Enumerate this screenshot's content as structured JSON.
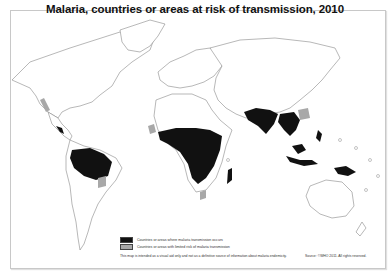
{
  "title": "Malaria, countries or areas at risk of transmission, 2010",
  "legend": {
    "items": [
      {
        "label": "Countries or areas where malaria transmission occurs",
        "color": "#111111"
      },
      {
        "label": "Countries or areas with limited risk of malaria transmission",
        "color": "#a8a8a8"
      }
    ]
  },
  "note": "This map is intended as a visual aid only and not as a definitive source of information about malaria endemicity.",
  "source": "Source: ©WHO 2011. All rights reserved.",
  "colors": {
    "transmission": "#111111",
    "limited_risk": "#a8a8a8",
    "no_risk": "#ffffff",
    "borders": "#888888"
  }
}
